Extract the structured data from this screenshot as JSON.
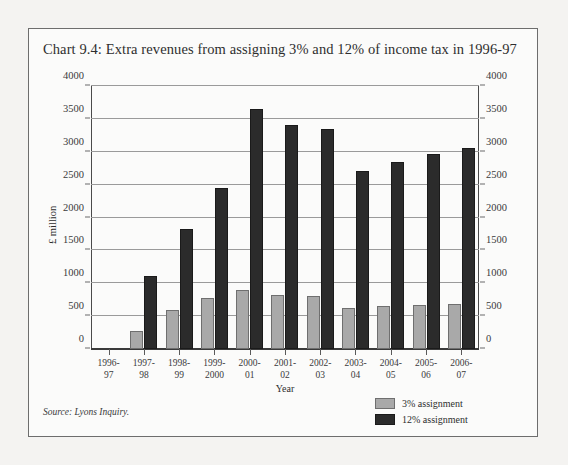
{
  "title": "Chart 9.4: Extra revenues from assigning 3% and 12% of income tax in 1996-97",
  "source": "Source: Lyons Inquiry.",
  "axis": {
    "ylabel": "£ million",
    "xlabel": "Year"
  },
  "legend": {
    "items": [
      {
        "label": "3% assignment",
        "color": "#a9a9a9"
      },
      {
        "label": "12% assignment",
        "color": "#2b2b2b"
      }
    ]
  },
  "chart_data": {
    "type": "bar",
    "title": "Chart 9.4: Extra revenues from assigning 3% and 12% of income tax in 1996-97",
    "xlabel": "Year",
    "ylabel": "£ million",
    "ylim": [
      0,
      4000
    ],
    "ytick_step": 500,
    "yticks": [
      0,
      500,
      1000,
      1500,
      2000,
      2500,
      3000,
      3500,
      4000
    ],
    "ytick_labels": [
      "0",
      "500",
      "1000",
      "1500",
      "2000",
      "2500",
      "3000",
      "3500",
      "4000"
    ],
    "grid": true,
    "legend_position": "bottom-right",
    "dual_y_axis": true,
    "categories": [
      "1996-97",
      "1997-98",
      "1998-99",
      "1999-2000",
      "2000-01",
      "2001-02",
      "2002-03",
      "2003-04",
      "2004-05",
      "2005-06",
      "2006-07"
    ],
    "category_lines": [
      [
        "1996-",
        "97"
      ],
      [
        "1997-",
        "98"
      ],
      [
        "1998-",
        "99"
      ],
      [
        "1999-",
        "2000"
      ],
      [
        "2000-",
        "01"
      ],
      [
        "2001-",
        "02"
      ],
      [
        "2002-",
        "03"
      ],
      [
        "2003-",
        "04"
      ],
      [
        "2004-",
        "05"
      ],
      [
        "2005-",
        "06"
      ],
      [
        "2006-",
        "07"
      ]
    ],
    "series": [
      {
        "name": "3% assignment",
        "color": "#a9a9a9",
        "values": [
          0,
          280,
          600,
          780,
          890,
          820,
          810,
          620,
          650,
          665,
          690
        ]
      },
      {
        "name": "12% assignment",
        "color": "#2b2b2b",
        "values": [
          0,
          1110,
          1820,
          2450,
          3650,
          3400,
          3350,
          2700,
          2850,
          2960,
          3050
        ]
      }
    ]
  }
}
